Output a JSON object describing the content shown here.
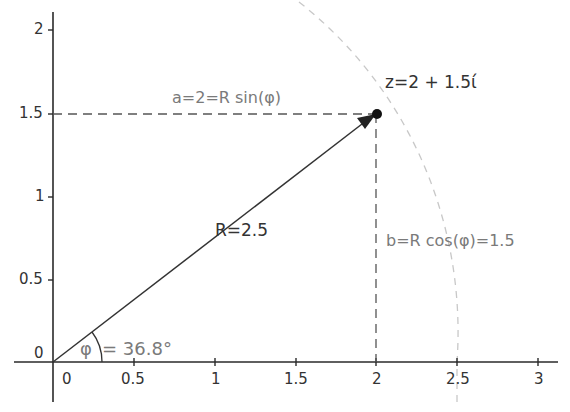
{
  "axes": {
    "x_ticks": [
      "0",
      "0.5",
      "1",
      "1.5",
      "2",
      "2.5",
      "3"
    ],
    "y_ticks": [
      "0",
      "0.5",
      "1",
      "1.5",
      "2"
    ]
  },
  "point": {
    "label": "z=2 + 1.5ί",
    "x": 2,
    "y": 1.5
  },
  "vector": {
    "label": "R=2.5",
    "magnitude": 2.5
  },
  "projections": {
    "horizontal_label": "a=2=R sin(φ)",
    "vertical_label": "b=R cos(φ)=1.5"
  },
  "angle": {
    "symbol": "φ",
    "value_label": "= 36.8°"
  },
  "circle": {
    "radius": 2.5
  },
  "colors": {
    "axis": "#2a2a2a",
    "vector": "#333333",
    "dashed": "#555555",
    "circle": "#c8c8c8",
    "label_gray": "#7a7a7a"
  }
}
